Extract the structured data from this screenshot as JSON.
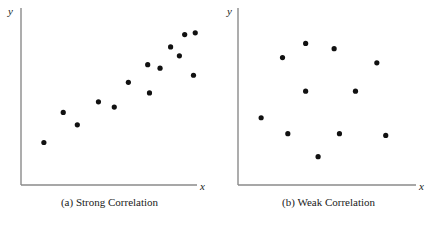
{
  "figure": {
    "background_color": "#ffffff",
    "axis_color": "#8a8a8a",
    "point_color": "#111111",
    "point_radius": 2.6
  },
  "panels": [
    {
      "id": "panel-a",
      "caption": "(a) Strong Correlation",
      "x_axis_label": "x",
      "y_axis_label": "y",
      "axis": {
        "origin_x": 21,
        "origin_y": 185,
        "top_y": 8,
        "right_x": 197
      }
    },
    {
      "id": "panel-b",
      "caption": "(b) Weak Correlation",
      "x_axis_label": "x",
      "y_axis_label": "y",
      "axis": {
        "origin_x": 19,
        "origin_y": 185,
        "top_y": 8,
        "right_x": 197
      }
    }
  ],
  "chart_data": [
    {
      "type": "scatter",
      "title": "(a) Strong Correlation",
      "xlabel": "x",
      "ylabel": "y",
      "grid": false,
      "legend": null,
      "axis_ticks": [],
      "xlim": [
        0,
        100
      ],
      "ylim": [
        0,
        100
      ],
      "points": [
        {
          "x": 13,
          "y": 24
        },
        {
          "x": 24,
          "y": 41
        },
        {
          "x": 32,
          "y": 34
        },
        {
          "x": 44,
          "y": 47
        },
        {
          "x": 53,
          "y": 44
        },
        {
          "x": 61,
          "y": 58
        },
        {
          "x": 72,
          "y": 68
        },
        {
          "x": 73,
          "y": 52
        },
        {
          "x": 79,
          "y": 66
        },
        {
          "x": 85,
          "y": 78
        },
        {
          "x": 90,
          "y": 73
        },
        {
          "x": 93,
          "y": 85
        },
        {
          "x": 98,
          "y": 62
        },
        {
          "x": 99,
          "y": 86
        }
      ]
    },
    {
      "type": "scatter",
      "title": "(b) Weak Correlation",
      "xlabel": "x",
      "ylabel": "y",
      "grid": false,
      "legend": null,
      "axis_ticks": [],
      "xlim": [
        0,
        100
      ],
      "ylim": [
        0,
        100
      ],
      "points": [
        {
          "x": 13,
          "y": 38
        },
        {
          "x": 25,
          "y": 72
        },
        {
          "x": 28,
          "y": 29
        },
        {
          "x": 38,
          "y": 80
        },
        {
          "x": 38,
          "y": 53
        },
        {
          "x": 45,
          "y": 16
        },
        {
          "x": 54,
          "y": 77
        },
        {
          "x": 57,
          "y": 29
        },
        {
          "x": 66,
          "y": 53
        },
        {
          "x": 78,
          "y": 69
        },
        {
          "x": 83,
          "y": 28
        }
      ]
    }
  ]
}
